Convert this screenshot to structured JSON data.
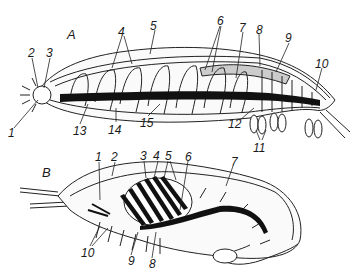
{
  "figure": {
    "panels": [
      {
        "id": "A",
        "label": "A",
        "subject": "segmented worm-like body, lateral view",
        "labels": [
          {
            "text": "1",
            "x": 10,
            "y": 130
          },
          {
            "text": "2",
            "x": 28,
            "y": 47
          },
          {
            "text": "3",
            "x": 46,
            "y": 47
          },
          {
            "text": "4",
            "x": 119,
            "y": 26
          },
          {
            "text": "5",
            "x": 152,
            "y": 20
          },
          {
            "text": "6",
            "x": 217,
            "y": 15
          },
          {
            "text": "7",
            "x": 239,
            "y": 22
          },
          {
            "text": "8",
            "x": 256,
            "y": 24
          },
          {
            "text": "9",
            "x": 285,
            "y": 33
          },
          {
            "text": "10",
            "x": 316,
            "y": 58
          },
          {
            "text": "11",
            "x": 256,
            "y": 142
          },
          {
            "text": "12",
            "x": 228,
            "y": 120
          },
          {
            "text": "13",
            "x": 74,
            "y": 126
          },
          {
            "text": "14",
            "x": 110,
            "y": 124
          },
          {
            "text": "15",
            "x": 141,
            "y": 118
          }
        ]
      },
      {
        "id": "B",
        "label": "B",
        "subject": "crustacean (shrimp-like) body, lateral view",
        "labels": [
          {
            "text": "1",
            "x": 96,
            "y": 151
          },
          {
            "text": "2",
            "x": 112,
            "y": 151
          },
          {
            "text": "3",
            "x": 141,
            "y": 150
          },
          {
            "text": "4",
            "x": 155,
            "y": 150
          },
          {
            "text": "5",
            "x": 166,
            "y": 150
          },
          {
            "text": "6",
            "x": 185,
            "y": 150
          },
          {
            "text": "7",
            "x": 230,
            "y": 156
          },
          {
            "text": "8",
            "x": 149,
            "y": 260
          },
          {
            "text": "9",
            "x": 128,
            "y": 257
          },
          {
            "text": "10",
            "x": 82,
            "y": 249
          }
        ]
      }
    ]
  }
}
